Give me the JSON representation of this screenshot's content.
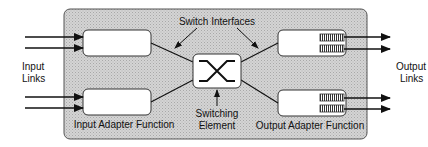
{
  "diagram": {
    "labels": {
      "switch_interfaces": "Switch Interfaces",
      "input_links_line1": "Input",
      "input_links_line2": "Links",
      "output_links_line1": "Output",
      "output_links_line2": "Links",
      "input_adapter": "Input Adapter Function",
      "output_adapter": "Output Adapter Function",
      "switching_line1": "Switching",
      "switching_line2": "Element"
    },
    "colors": {
      "panel_fill": "#cfcfcf",
      "box_fill": "#ffffff",
      "stroke": "#111111"
    }
  }
}
